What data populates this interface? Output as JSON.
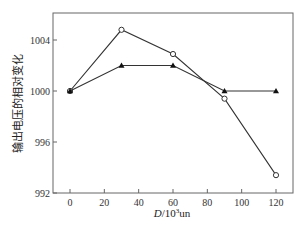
{
  "chart_data": {
    "type": "line",
    "title": "",
    "xlabel": "D/10³un",
    "xlabel_parts": {
      "italic": "D",
      "rest": "/10",
      "sup": "3",
      "unit": "un"
    },
    "ylabel": "输出电压的相对变化",
    "x": [
      0,
      30,
      60,
      90,
      120
    ],
    "xticks": [
      0,
      20,
      40,
      60,
      80,
      100,
      120
    ],
    "yticks": [
      992,
      996,
      1000,
      1004
    ],
    "xlim": [
      -10,
      130
    ],
    "ylim": [
      992,
      1006.2
    ],
    "grid": false,
    "legend": null,
    "series": [
      {
        "name": "open-circle-series",
        "marker": "circle-open",
        "values": [
          1000,
          1004.8,
          1002.9,
          999.4,
          993.4
        ]
      },
      {
        "name": "filled-triangle-series",
        "marker": "triangle-filled",
        "values": [
          1000,
          1002,
          1002,
          1000,
          1000
        ]
      }
    ]
  },
  "colors": {
    "line": "#333333",
    "axis": "#555555",
    "background": "#ffffff"
  }
}
